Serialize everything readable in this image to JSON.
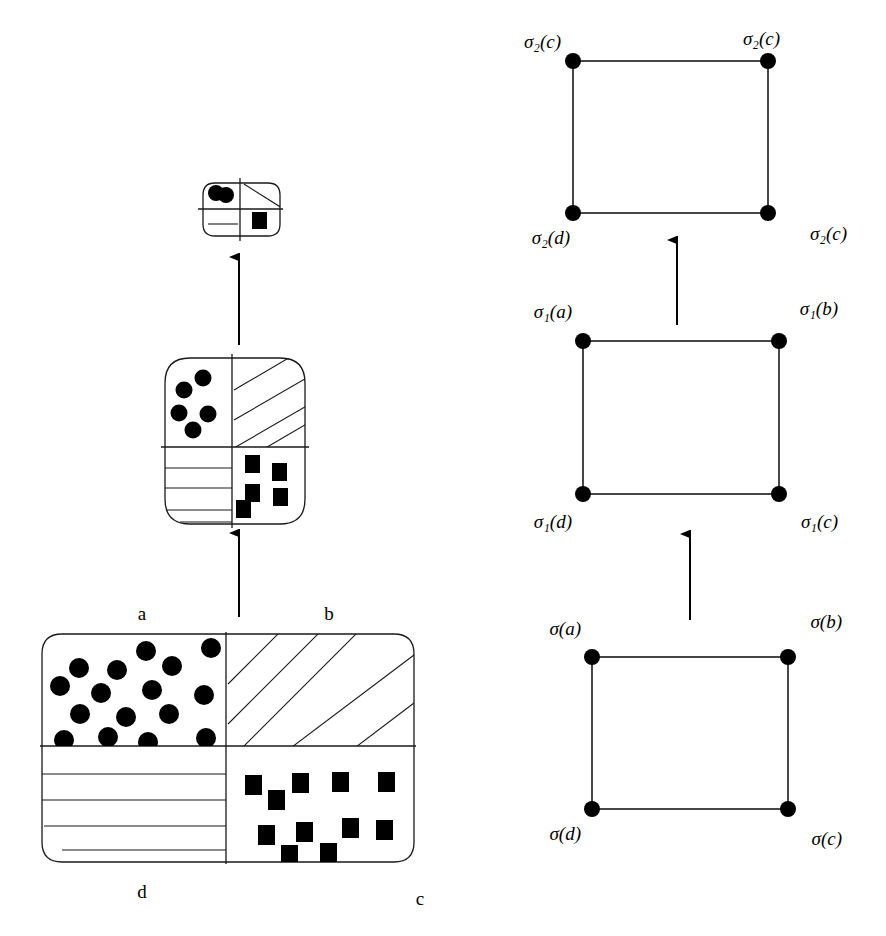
{
  "figure": {
    "title": ""
  },
  "left_column": {
    "big_region": {
      "name": "base-region",
      "quadrant_labels": {
        "top_left": "a",
        "top_right": "b",
        "bottom_left": "d",
        "bottom_right": "c"
      },
      "fills": {
        "top_left": "circles",
        "top_right": "diagonal-hatch",
        "bottom_left": "horizontal-lines",
        "bottom_right": "squares"
      },
      "circle_count": 16,
      "square_count": 11,
      "diagonal_line_count": 4,
      "horizontal_line_count": 4
    },
    "mid_region": {
      "name": "sigma1-region",
      "fills": {
        "top_left": "circles",
        "top_right": "diagonal-hatch",
        "bottom_left": "horizontal-lines",
        "bottom_right": "squares"
      },
      "circle_count": 5,
      "square_count": 5,
      "diagonal_line_count": 3,
      "horizontal_line_count": 3
    },
    "small_region": {
      "name": "sigma2-region",
      "fills": {
        "top_left": "circles",
        "top_right": "diagonal-hatch",
        "bottom_left": "horizontal-lines",
        "bottom_right": "squares"
      },
      "circle_count": 2,
      "square_count": 1,
      "diagonal_line_count": 1,
      "horizontal_line_count": 1
    },
    "arrows": [
      {
        "name": "arrow-base-to-mid",
        "direction": "up"
      },
      {
        "name": "arrow-mid-to-small",
        "direction": "up"
      }
    ]
  },
  "right_column": {
    "squares": [
      {
        "name": "lattice-sigma2",
        "vertices": {
          "top_left": "σ₂(c)",
          "top_right": "σ₂(c)",
          "bottom_left": "σ₂(d)",
          "bottom_right": "σ₂(c)"
        }
      },
      {
        "name": "lattice-sigma1",
        "vertices": {
          "top_left": "σ₁(a)",
          "top_right": "σ₁(b)",
          "bottom_left": "σ₁(d)",
          "bottom_right": "σ₁(c)"
        }
      },
      {
        "name": "lattice-sigma",
        "vertices": {
          "top_left": "σ(a)",
          "top_right": "σ(b)",
          "bottom_left": "σ(d)",
          "bottom_right": "σ(c)"
        }
      }
    ],
    "arrows": [
      {
        "name": "arrow-sigma-to-sigma1",
        "direction": "up"
      },
      {
        "name": "arrow-sigma1-to-sigma2",
        "direction": "up"
      }
    ]
  },
  "colors": {
    "stroke": "#1a1a1a",
    "fill_marker": "#000000",
    "background": "#ffffff"
  }
}
